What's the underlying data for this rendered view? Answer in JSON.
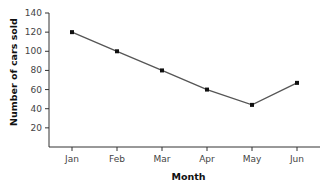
{
  "chart_data": {
    "type": "line",
    "title": "",
    "xlabel": "Month",
    "ylabel": "Number of cars sold",
    "categories": [
      "Jan",
      "Feb",
      "Mar",
      "Apr",
      "May",
      "Jun"
    ],
    "series": [
      {
        "name": "Cars sold",
        "values": [
          120,
          100,
          80,
          60,
          44,
          67
        ]
      }
    ],
    "yticks": [
      20,
      40,
      60,
      80,
      100,
      120,
      140
    ],
    "ylim": [
      0,
      140
    ],
    "grid": false,
    "legend": null,
    "marker": "square",
    "line_color": "#555555",
    "marker_color": "#111111"
  }
}
